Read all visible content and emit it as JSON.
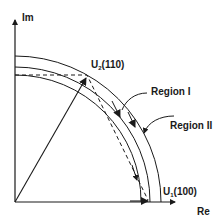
{
  "diagram": {
    "axes": {
      "x_label": "Re",
      "y_label": "Im"
    },
    "points": {
      "u1": {
        "symbol": "U",
        "subscript": "1",
        "state": "(100)"
      },
      "u2": {
        "symbol": "U",
        "subscript": "2",
        "state": "(110)"
      }
    },
    "regions": {
      "region1": "Region I",
      "region2": "Region II"
    },
    "colors": {
      "stroke": "#1a1a1a",
      "background": "#ffffff"
    }
  }
}
